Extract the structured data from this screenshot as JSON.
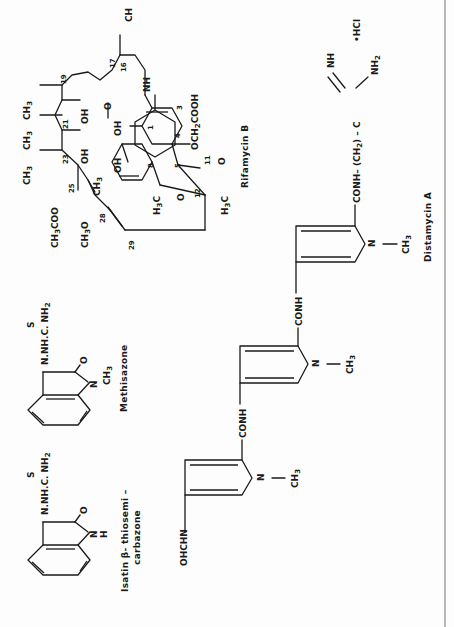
{
  "page": {
    "orientation": "rotated 90 degrees counter-clockwise",
    "background": "#fdfdfd",
    "ink": "#1a1a1a",
    "rule_color": "#8a8a8a"
  },
  "structures": {
    "isatin": {
      "name_line1": "Isatin  β- thiosemi –",
      "name_line2": "carbazone",
      "labels": {
        "side_chain": "N.NH.C. NH",
        "side_sub": "2",
        "sulfur": "S",
        "oxygen": "O",
        "nitrogen": "N",
        "hydrogen": "H"
      }
    },
    "methisazone": {
      "name": "Methisazone",
      "labels": {
        "side_chain": "N.NH.C. NH",
        "side_sub": "2",
        "sulfur": "S",
        "oxygen": "O",
        "nitrogen": "N",
        "methyl": "CH",
        "methyl_sub": "3"
      }
    },
    "rifamycin": {
      "name": "Rifamycin B",
      "labels": {
        "ch3_16": "CH",
        "nh": "NH",
        "o_amide": "O",
        "och2cooh": "OCH",
        "och2cooh_tail": "COOH",
        "oh1": "OH",
        "oh8": "OH",
        "oh21": "OH",
        "oh23": "OH",
        "ch3_a": "CH",
        "ch3_b": "CH",
        "ch3_c": "CH",
        "ch3_d": "CH",
        "ch3coo": "CH",
        "ch3coo_tail": "COO",
        "ch3o": "CH",
        "ch3o_tail": "O",
        "h3c_a": "H",
        "h3c_a_tail": "C",
        "h3c_b": "H",
        "h3c_b_tail": "C",
        "o_ketone": "O",
        "o_ring": "O",
        "sub3": "3",
        "sub2": "2"
      },
      "numbers": [
        "17",
        "16",
        "19",
        "21",
        "23",
        "25",
        "28",
        "29",
        "1",
        "3",
        "4",
        "5",
        "8",
        "11",
        "12"
      ]
    },
    "distamycin": {
      "name": "Distamycin  A",
      "labels": {
        "formyl": "OHCHN",
        "conh_1": "CONH",
        "conh_2": "CONH",
        "conh_3": "CONH– (CH",
        "conh_3_tail": ")  – C",
        "sub2": "2",
        "imine": "NH",
        "amine": "NH",
        "amine_sub": "2",
        "hcl": "•HCl",
        "n": "N",
        "ch3": "CH",
        "ch3_sub": "3"
      }
    }
  }
}
